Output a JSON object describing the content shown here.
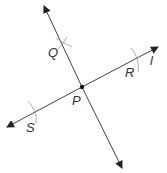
{
  "diagram": {
    "type": "geometry-construction",
    "colors": {
      "line": "#333333",
      "arc": "#999999",
      "text": "#333333"
    },
    "line_l": {
      "label": "l",
      "from": [
        7,
        127
      ],
      "to": [
        158,
        47
      ]
    },
    "perpendicular": {
      "from": [
        44,
        6
      ],
      "to": [
        122,
        168
      ]
    },
    "points": [
      {
        "name": "P",
        "label": "P",
        "x": 82,
        "y": 87,
        "label_x": 72,
        "label_y": 104
      },
      {
        "name": "Q",
        "label": "Q",
        "x": 63,
        "y": 45,
        "label_x": 48,
        "label_y": 57
      },
      {
        "name": "R",
        "label": "R",
        "x": 136,
        "y": 59,
        "label_x": 125,
        "label_y": 76
      },
      {
        "name": "S",
        "label": "S",
        "x": 33,
        "y": 113,
        "label_x": 26,
        "label_y": 131
      }
    ],
    "line_label": {
      "text": "l",
      "x": 150,
      "y": 64
    }
  }
}
